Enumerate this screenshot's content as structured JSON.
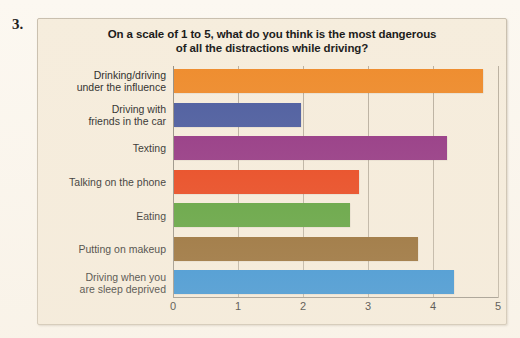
{
  "question_number": "3.",
  "chart_data": {
    "type": "bar",
    "orientation": "horizontal",
    "title": "On a scale of 1 to 5, what do you think is the most dangerous of all the distractions while driving?",
    "title_lines": [
      "On a scale of 1 to 5, what do you think is the most dangerous",
      "of all the distractions while driving?"
    ],
    "xlabel": "",
    "ylabel": "",
    "xlim": [
      0,
      5
    ],
    "xticks": [
      0,
      1,
      2,
      3,
      4,
      5
    ],
    "xtick_labels": [
      "0",
      "1",
      "2",
      "3",
      "4",
      "5"
    ],
    "grid": true,
    "legend": "none",
    "categories": [
      "Drinking/driving under the influence",
      "Driving with friends in the car",
      "Texting",
      "Talking on the phone",
      "Eating",
      "Putting on makeup",
      "Driving when you are sleep deprived"
    ],
    "category_lines": [
      [
        "Drinking/driving",
        "under the influence"
      ],
      [
        "Driving with",
        "friends in the car"
      ],
      [
        "Texting"
      ],
      [
        "Talking on the phone"
      ],
      [
        "Eating"
      ],
      [
        "Putting on makeup"
      ],
      [
        "Driving when you",
        "are sleep deprived"
      ]
    ],
    "values": [
      4.75,
      1.95,
      4.2,
      2.85,
      2.7,
      3.75,
      4.3
    ],
    "colors": [
      "#ee8724",
      "#42549c",
      "#8e2a7e",
      "#e8380d",
      "#4f9b2d",
      "#8b5e20",
      "#1e86d4"
    ],
    "panel_background": "#f6eddd"
  }
}
